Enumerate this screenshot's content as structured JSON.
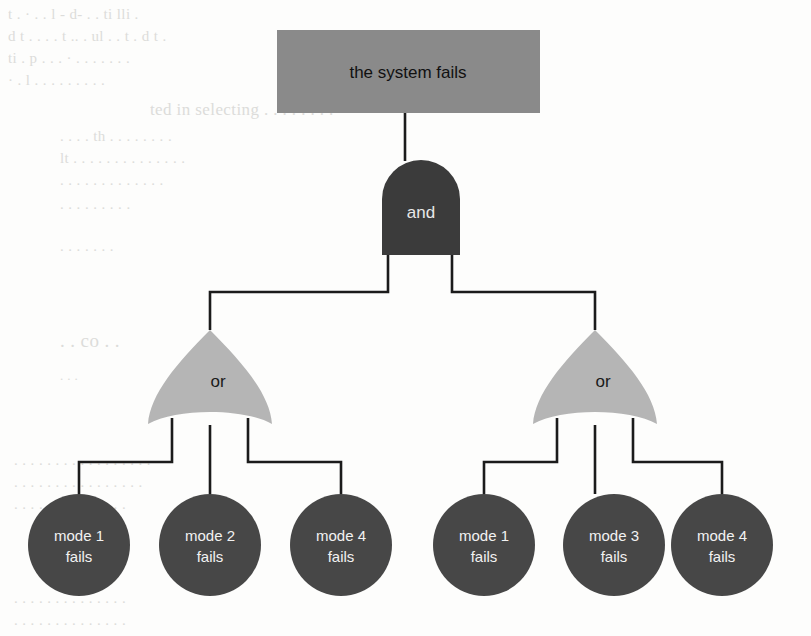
{
  "diagram": {
    "type": "fault-tree",
    "title": "the system fails",
    "colors": {
      "top_event_fill": "#8a8a8a",
      "and_gate_fill": "#3b3b3b",
      "or_gate_fill": "#b5b5b5",
      "leaf_fill": "#474747",
      "edge": "#1b1b1b",
      "page_background": "#fdfdfc",
      "ghost_text": "#c9c9c6"
    },
    "top_event": {
      "label": "the system fails",
      "shape": "rectangle"
    },
    "root_gate": {
      "label": "and",
      "shape": "and-gate"
    },
    "gates": [
      {
        "label": "or",
        "shape": "or-gate",
        "side": "left",
        "children": [
          {
            "line1": "mode 1",
            "line2": "fails"
          },
          {
            "line1": "mode 2",
            "line2": "fails"
          },
          {
            "line1": "mode 4",
            "line2": "fails"
          }
        ]
      },
      {
        "label": "or",
        "shape": "or-gate",
        "side": "right",
        "children": [
          {
            "line1": "mode 1",
            "line2": "fails"
          },
          {
            "line1": "mode 3",
            "line2": "fails"
          },
          {
            "line1": "mode 4",
            "line2": "fails"
          }
        ]
      }
    ]
  },
  "background_text": {
    "lines": [
      {
        "text": "t .  ·    . . l  - d-  .   .   ti    lli   .",
        "x": 8,
        "y": 6,
        "size": 15
      },
      {
        "text": "d  t   .   .   . .  t .. .   ul     .  . t  .  d t  .",
        "x": 8,
        "y": 28,
        "size": 15
      },
      {
        "text": "ti         .   p  .  . . ·  .  .   .    .   .  .   .",
        "x": 8,
        "y": 50,
        "size": 15
      },
      {
        "text": "·  .  l   .    .   .     .      .     .    .   .  .",
        "x": 8,
        "y": 72,
        "size": 15
      },
      {
        "text": "ted in selecting  .   . .  .   .    .  . .",
        "x": 150,
        "y": 100,
        "size": 17
      },
      {
        "text": ".    . .  .   th  .    .  .   . .   .   .   .",
        "x": 60,
        "y": 128,
        "size": 15
      },
      {
        "text": "lt  . . .   .   .  .    .   .  .   . .    . .  .",
        "x": 60,
        "y": 150,
        "size": 15
      },
      {
        "text": ".  . .  . .   .      .   .   .   .   .   . .",
        "x": 60,
        "y": 172,
        "size": 15
      },
      {
        "text": ". .   . .  .  .   .  .   .",
        "x": 60,
        "y": 196,
        "size": 15
      },
      {
        "text": ".   . . .   .    .     .",
        "x": 60,
        "y": 238,
        "size": 15
      },
      {
        "text": ". .   co   .     .",
        "x": 60,
        "y": 330,
        "size": 19
      },
      {
        "text": ".   .  .",
        "x": 60,
        "y": 368,
        "size": 13
      },
      {
        "text": ".   .   . .  .  .    .   .  .  . .   .  .   .   .  .  .",
        "x": 14,
        "y": 452,
        "size": 15
      },
      {
        "text": ".   . .  .  .   .   .  .   .  .  .   .   . . .   .",
        "x": 14,
        "y": 474,
        "size": 15
      },
      {
        "text": ".  .   .  .  .   .    .  .   . .   .   .  .  .",
        "x": 14,
        "y": 496,
        "size": 15
      },
      {
        "text": ".  .   .  .  . .   .   .  .    .  .   .   .  .",
        "x": 14,
        "y": 590,
        "size": 15
      },
      {
        "text": ".   . .   .  .   .  .    .   .  .  .   .  .  .",
        "x": 14,
        "y": 612,
        "size": 15
      }
    ]
  }
}
